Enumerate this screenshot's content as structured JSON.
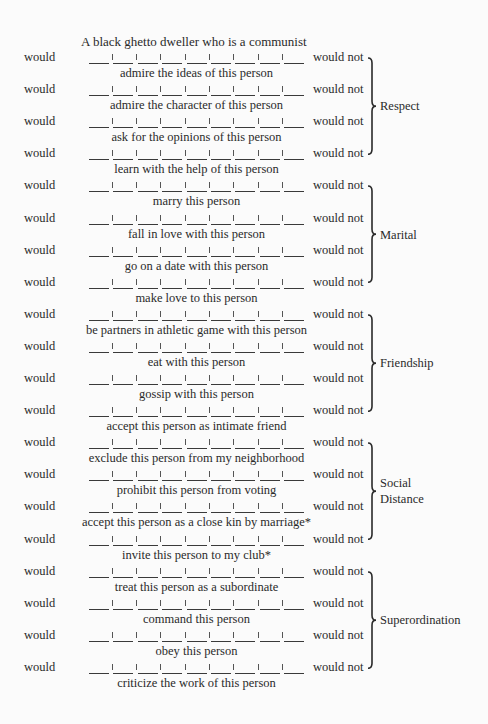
{
  "title": "A black ghetto dweller who is a communist",
  "scale": {
    "left_label": "would",
    "right_label": "would not",
    "segments": 9
  },
  "items": [
    {
      "caption": "admire the ideas of this person"
    },
    {
      "caption": "admire the character of this person"
    },
    {
      "caption": "ask for the opinions of this person"
    },
    {
      "caption": "learn with the help of this person"
    },
    {
      "caption": "marry this person"
    },
    {
      "caption": "fall in love with this person"
    },
    {
      "caption": "go on a date with this person"
    },
    {
      "caption": "make love to this person"
    },
    {
      "caption": "be partners in athletic game with this person"
    },
    {
      "caption": "eat with this person"
    },
    {
      "caption": "gossip with this person"
    },
    {
      "caption": "accept this person as intimate friend"
    },
    {
      "caption": "exclude this person from my neighborhood"
    },
    {
      "caption": "prohibit this person from voting"
    },
    {
      "caption": "accept this person as a close kin by marriage*"
    },
    {
      "caption": "invite this person to my club*"
    },
    {
      "caption": "treat this person as a subordinate"
    },
    {
      "caption": "command this person"
    },
    {
      "caption": "obey this person"
    },
    {
      "caption": "criticize the work of this person"
    }
  ],
  "groups": [
    {
      "label": "Respect",
      "label2": "",
      "start_row": 0,
      "end_row": 3
    },
    {
      "label": "Marital",
      "label2": "",
      "start_row": 4,
      "end_row": 7
    },
    {
      "label": "Friendship",
      "label2": "",
      "start_row": 8,
      "end_row": 11
    },
    {
      "label": "Social",
      "label2": "Distance",
      "start_row": 12,
      "end_row": 15
    },
    {
      "label": "Superordination",
      "label2": "",
      "start_row": 16,
      "end_row": 19
    }
  ]
}
